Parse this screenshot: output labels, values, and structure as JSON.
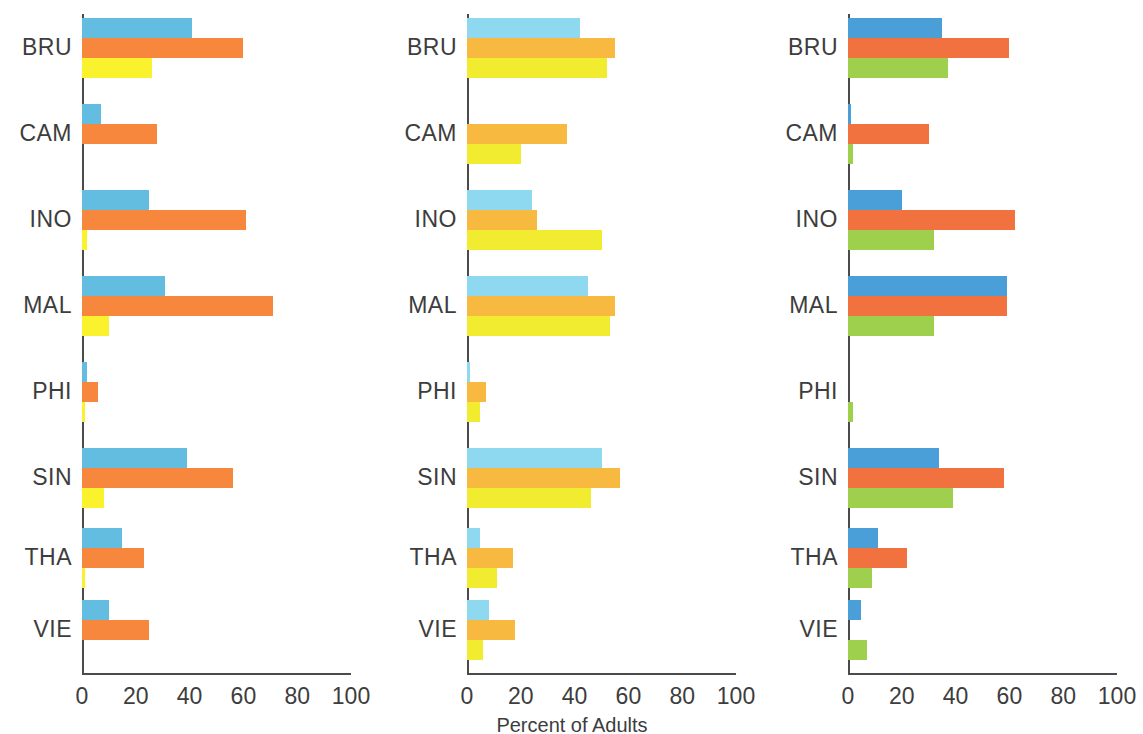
{
  "chart_data": {
    "type": "bar",
    "orientation": "horizontal",
    "title": "",
    "xlabel": "Percent of Adults",
    "ylabel": "",
    "xlim": [
      0,
      100
    ],
    "xticks": [
      0,
      20,
      40,
      60,
      80,
      100
    ],
    "grid": false,
    "legend": "none",
    "categories": [
      "BRU",
      "CAM",
      "INO",
      "MAL",
      "PHI",
      "SIN",
      "THA",
      "VIE"
    ],
    "panels": [
      {
        "name": "panel-1",
        "series": [
          {
            "name": "series-1",
            "color": "#62bde0",
            "values": [
              41,
              7,
              25,
              31,
              2,
              39,
              15,
              10
            ]
          },
          {
            "name": "series-2",
            "color": "#f6873d",
            "values": [
              60,
              28,
              61,
              71,
              6,
              56,
              23,
              25
            ]
          },
          {
            "name": "series-3",
            "color": "#fbf22e",
            "values": [
              26,
              0,
              2,
              10,
              1,
              8,
              1,
              0
            ]
          }
        ]
      },
      {
        "name": "panel-2",
        "series": [
          {
            "name": "series-1",
            "color": "#8ed9ef",
            "values": [
              42,
              0,
              24,
              45,
              1,
              50,
              5,
              8
            ]
          },
          {
            "name": "series-2",
            "color": "#f8b940",
            "values": [
              55,
              37,
              26,
              55,
              7,
              57,
              17,
              18
            ]
          },
          {
            "name": "series-3",
            "color": "#f2ec30",
            "values": [
              52,
              20,
              50,
              53,
              5,
              46,
              11,
              6
            ]
          }
        ]
      },
      {
        "name": "panel-3",
        "series": [
          {
            "name": "series-1",
            "color": "#4a9fd8",
            "values": [
              35,
              1,
              20,
              59,
              0,
              34,
              11,
              5
            ]
          },
          {
            "name": "series-2",
            "color": "#f1713f",
            "values": [
              60,
              30,
              62,
              59,
              0,
              58,
              22,
              0
            ]
          },
          {
            "name": "series-3",
            "color": "#9ed04e",
            "values": [
              37,
              2,
              32,
              32,
              2,
              39,
              9,
              7
            ]
          }
        ]
      }
    ]
  },
  "layout": {
    "panel_x": [
      82,
      467,
      848
    ],
    "panel_plot_width": 269,
    "label_right": [
      72,
      457,
      838
    ],
    "row_tops": [
      18,
      104,
      190,
      276,
      362,
      448,
      528,
      600
    ],
    "row_height": 62,
    "bar_height": 20,
    "axis_y": 673,
    "tick_y": 683,
    "xlabel_x": 572,
    "xlabel_y": 714
  }
}
